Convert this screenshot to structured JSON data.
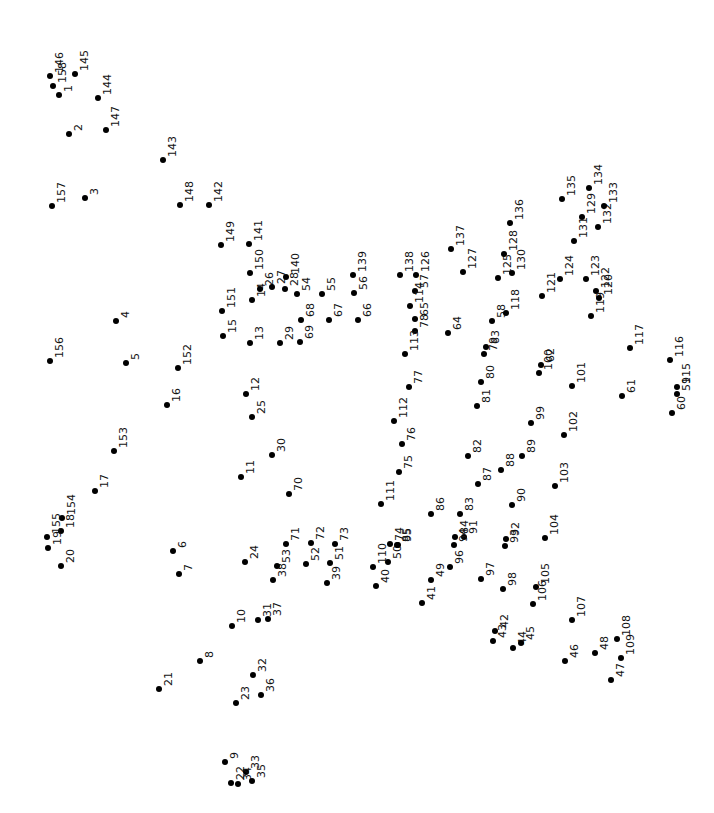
{
  "puzzle": {
    "type": "connect-the-dots",
    "dot_color": "#000000",
    "background": "#ffffff",
    "total_dots": 158,
    "dots": [
      {
        "n": "1",
        "x": 59,
        "y": 95
      },
      {
        "n": "2",
        "x": 69,
        "y": 134
      },
      {
        "n": "3",
        "x": 85,
        "y": 198
      },
      {
        "n": "4",
        "x": 116,
        "y": 321
      },
      {
        "n": "5",
        "x": 126,
        "y": 363
      },
      {
        "n": "6",
        "x": 173,
        "y": 551
      },
      {
        "n": "7",
        "x": 179,
        "y": 574
      },
      {
        "n": "8",
        "x": 200,
        "y": 661
      },
      {
        "n": "9",
        "x": 225,
        "y": 762
      },
      {
        "n": "10",
        "x": 232,
        "y": 626
      },
      {
        "n": "11",
        "x": 241,
        "y": 477
      },
      {
        "n": "12",
        "x": 246,
        "y": 394
      },
      {
        "n": "13",
        "x": 250,
        "y": 343
      },
      {
        "n": "14",
        "x": 252,
        "y": 300
      },
      {
        "n": "15",
        "x": 223,
        "y": 336
      },
      {
        "n": "16",
        "x": 167,
        "y": 405
      },
      {
        "n": "17",
        "x": 95,
        "y": 491
      },
      {
        "n": "18",
        "x": 61,
        "y": 531
      },
      {
        "n": "19",
        "x": 48,
        "y": 548
      },
      {
        "n": "20",
        "x": 61,
        "y": 566
      },
      {
        "n": "21",
        "x": 159,
        "y": 689
      },
      {
        "n": "22",
        "x": 231,
        "y": 783
      },
      {
        "n": "23",
        "x": 236,
        "y": 703
      },
      {
        "n": "24",
        "x": 245,
        "y": 562
      },
      {
        "n": "25",
        "x": 252,
        "y": 417
      },
      {
        "n": "26",
        "x": 260,
        "y": 289
      },
      {
        "n": "27",
        "x": 272,
        "y": 287
      },
      {
        "n": "28",
        "x": 285,
        "y": 289
      },
      {
        "n": "29",
        "x": 280,
        "y": 343
      },
      {
        "n": "30",
        "x": 272,
        "y": 455
      },
      {
        "n": "31",
        "x": 258,
        "y": 620
      },
      {
        "n": "32",
        "x": 253,
        "y": 675
      },
      {
        "n": "33",
        "x": 246,
        "y": 772
      },
      {
        "n": "34",
        "x": 238,
        "y": 784
      },
      {
        "n": "35",
        "x": 252,
        "y": 781
      },
      {
        "n": "36",
        "x": 261,
        "y": 695
      },
      {
        "n": "37",
        "x": 268,
        "y": 619
      },
      {
        "n": "38",
        "x": 273,
        "y": 580
      },
      {
        "n": "39",
        "x": 327,
        "y": 583
      },
      {
        "n": "40",
        "x": 376,
        "y": 586
      },
      {
        "n": "41",
        "x": 422,
        "y": 603
      },
      {
        "n": "42",
        "x": 495,
        "y": 631
      },
      {
        "n": "43",
        "x": 493,
        "y": 641
      },
      {
        "n": "44",
        "x": 513,
        "y": 648
      },
      {
        "n": "45",
        "x": 521,
        "y": 643
      },
      {
        "n": "46",
        "x": 565,
        "y": 661
      },
      {
        "n": "47",
        "x": 611,
        "y": 680
      },
      {
        "n": "48",
        "x": 595,
        "y": 653
      },
      {
        "n": "49",
        "x": 431,
        "y": 580
      },
      {
        "n": "50",
        "x": 388,
        "y": 562
      },
      {
        "n": "51",
        "x": 330,
        "y": 563
      },
      {
        "n": "52",
        "x": 306,
        "y": 564
      },
      {
        "n": "53",
        "x": 277,
        "y": 566
      },
      {
        "n": "54",
        "x": 297,
        "y": 294
      },
      {
        "n": "55",
        "x": 322,
        "y": 294
      },
      {
        "n": "56",
        "x": 354,
        "y": 293
      },
      {
        "n": "57",
        "x": 415,
        "y": 291
      },
      {
        "n": "58",
        "x": 492,
        "y": 321
      },
      {
        "n": "59",
        "x": 677,
        "y": 394
      },
      {
        "n": "60",
        "x": 672,
        "y": 413
      },
      {
        "n": "61",
        "x": 622,
        "y": 396
      },
      {
        "n": "62",
        "x": 541,
        "y": 365
      },
      {
        "n": "63",
        "x": 486,
        "y": 347
      },
      {
        "n": "64",
        "x": 448,
        "y": 333
      },
      {
        "n": "65",
        "x": 415,
        "y": 319
      },
      {
        "n": "66",
        "x": 358,
        "y": 320
      },
      {
        "n": "67",
        "x": 329,
        "y": 320
      },
      {
        "n": "68",
        "x": 301,
        "y": 320
      },
      {
        "n": "69",
        "x": 300,
        "y": 342
      },
      {
        "n": "70",
        "x": 289,
        "y": 494
      },
      {
        "n": "71",
        "x": 286,
        "y": 544
      },
      {
        "n": "72",
        "x": 311,
        "y": 543
      },
      {
        "n": "73",
        "x": 335,
        "y": 544
      },
      {
        "n": "74",
        "x": 390,
        "y": 544
      },
      {
        "n": "75",
        "x": 399,
        "y": 472
      },
      {
        "n": "76",
        "x": 402,
        "y": 444
      },
      {
        "n": "77",
        "x": 409,
        "y": 387
      },
      {
        "n": "78",
        "x": 415,
        "y": 331
      },
      {
        "n": "79",
        "x": 484,
        "y": 354
      },
      {
        "n": "80",
        "x": 481,
        "y": 382
      },
      {
        "n": "81",
        "x": 477,
        "y": 406
      },
      {
        "n": "82",
        "x": 468,
        "y": 456
      },
      {
        "n": "83",
        "x": 460,
        "y": 514
      },
      {
        "n": "84",
        "x": 455,
        "y": 537
      },
      {
        "n": "85",
        "x": 397,
        "y": 545
      },
      {
        "n": "86",
        "x": 431,
        "y": 514
      },
      {
        "n": "87",
        "x": 478,
        "y": 484
      },
      {
        "n": "88",
        "x": 501,
        "y": 470
      },
      {
        "n": "89",
        "x": 522,
        "y": 456
      },
      {
        "n": "90",
        "x": 512,
        "y": 505
      },
      {
        "n": "91",
        "x": 464,
        "y": 537
      },
      {
        "n": "92",
        "x": 506,
        "y": 539
      },
      {
        "n": "93",
        "x": 505,
        "y": 546
      },
      {
        "n": "94",
        "x": 454,
        "y": 545
      },
      {
        "n": "95",
        "x": 398,
        "y": 545
      },
      {
        "n": "96",
        "x": 450,
        "y": 567
      },
      {
        "n": "97",
        "x": 481,
        "y": 579
      },
      {
        "n": "98",
        "x": 503,
        "y": 589
      },
      {
        "n": "99",
        "x": 531,
        "y": 423
      },
      {
        "n": "100",
        "x": 539,
        "y": 373
      },
      {
        "n": "101",
        "x": 572,
        "y": 386
      },
      {
        "n": "102",
        "x": 564,
        "y": 435
      },
      {
        "n": "103",
        "x": 555,
        "y": 486
      },
      {
        "n": "104",
        "x": 545,
        "y": 538
      },
      {
        "n": "105",
        "x": 536,
        "y": 587
      },
      {
        "n": "106",
        "x": 533,
        "y": 604
      },
      {
        "n": "107",
        "x": 572,
        "y": 620
      },
      {
        "n": "108",
        "x": 617,
        "y": 639
      },
      {
        "n": "109",
        "x": 621,
        "y": 658
      },
      {
        "n": "110",
        "x": 373,
        "y": 567
      },
      {
        "n": "111",
        "x": 381,
        "y": 504
      },
      {
        "n": "112",
        "x": 394,
        "y": 421
      },
      {
        "n": "113",
        "x": 405,
        "y": 354
      },
      {
        "n": "114",
        "x": 410,
        "y": 306
      },
      {
        "n": "115",
        "x": 677,
        "y": 387
      },
      {
        "n": "116",
        "x": 670,
        "y": 360
      },
      {
        "n": "117",
        "x": 630,
        "y": 348
      },
      {
        "n": "118",
        "x": 506,
        "y": 313
      },
      {
        "n": "119",
        "x": 591,
        "y": 316
      },
      {
        "n": "120",
        "x": 599,
        "y": 298
      },
      {
        "n": "121",
        "x": 542,
        "y": 296
      },
      {
        "n": "122",
        "x": 596,
        "y": 291
      },
      {
        "n": "123",
        "x": 586,
        "y": 279
      },
      {
        "n": "124",
        "x": 560,
        "y": 279
      },
      {
        "n": "125",
        "x": 498,
        "y": 278
      },
      {
        "n": "126",
        "x": 416,
        "y": 275
      },
      {
        "n": "127",
        "x": 463,
        "y": 272
      },
      {
        "n": "128",
        "x": 504,
        "y": 254
      },
      {
        "n": "129",
        "x": 582,
        "y": 217
      },
      {
        "n": "130",
        "x": 512,
        "y": 273
      },
      {
        "n": "131",
        "x": 574,
        "y": 241
      },
      {
        "n": "132",
        "x": 598,
        "y": 227
      },
      {
        "n": "133",
        "x": 604,
        "y": 206
      },
      {
        "n": "134",
        "x": 589,
        "y": 188
      },
      {
        "n": "135",
        "x": 562,
        "y": 199
      },
      {
        "n": "136",
        "x": 510,
        "y": 223
      },
      {
        "n": "137",
        "x": 451,
        "y": 249
      },
      {
        "n": "138",
        "x": 400,
        "y": 275
      },
      {
        "n": "139",
        "x": 353,
        "y": 275
      },
      {
        "n": "140",
        "x": 286,
        "y": 277
      },
      {
        "n": "141",
        "x": 249,
        "y": 244
      },
      {
        "n": "142",
        "x": 209,
        "y": 205
      },
      {
        "n": "143",
        "x": 163,
        "y": 160
      },
      {
        "n": "144",
        "x": 98,
        "y": 98
      },
      {
        "n": "145",
        "x": 75,
        "y": 74
      },
      {
        "n": "146",
        "x": 50,
        "y": 76
      },
      {
        "n": "147",
        "x": 106,
        "y": 130
      },
      {
        "n": "148",
        "x": 180,
        "y": 205
      },
      {
        "n": "149",
        "x": 221,
        "y": 245
      },
      {
        "n": "150",
        "x": 250,
        "y": 273
      },
      {
        "n": "151",
        "x": 222,
        "y": 311
      },
      {
        "n": "152",
        "x": 178,
        "y": 368
      },
      {
        "n": "153",
        "x": 114,
        "y": 451
      },
      {
        "n": "154",
        "x": 62,
        "y": 518
      },
      {
        "n": "155",
        "x": 47,
        "y": 537
      },
      {
        "n": "156",
        "x": 50,
        "y": 361
      },
      {
        "n": "157",
        "x": 52,
        "y": 206
      },
      {
        "n": "158",
        "x": 53,
        "y": 86
      }
    ]
  }
}
